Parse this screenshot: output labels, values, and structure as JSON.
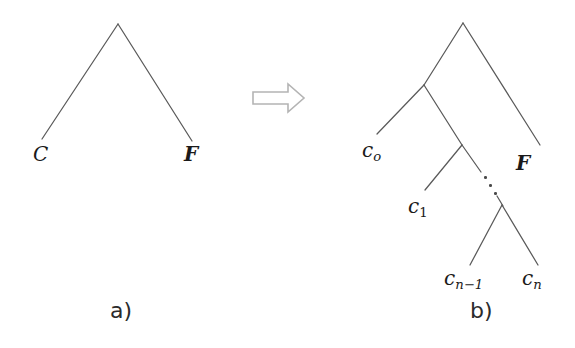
{
  "figure": {
    "background_color": "#ffffff",
    "line_color": "#5a5a5a",
    "arrow_outline_color": "#b4b4b4",
    "text_color": "#1a1a1a"
  },
  "panel_a": {
    "caption": "a)",
    "caption_position": {
      "x": 110,
      "y": 300
    },
    "tree": {
      "root": {
        "x": 118,
        "y": 24
      },
      "edges": [
        {
          "name": "root-to-C",
          "x1": 118,
          "y1": 24,
          "x2": 42,
          "y2": 139
        },
        {
          "name": "root-to-F",
          "x1": 118,
          "y1": 24,
          "x2": 192,
          "y2": 141
        }
      ],
      "leaves": [
        {
          "id": "C",
          "label": "C",
          "style": "italic",
          "x": 33,
          "y": 144
        },
        {
          "id": "F",
          "label": "F",
          "style": "bold-italic",
          "x": 184,
          "y": 144
        }
      ]
    }
  },
  "arrow": {
    "name": "double-right-arrow",
    "label": "implies",
    "x": 253,
    "y": 84,
    "width": 52,
    "height": 28
  },
  "panel_b": {
    "caption": "b)",
    "caption_position": {
      "x": 470,
      "y": 300
    },
    "tree": {
      "root": {
        "x": 463,
        "y": 23
      },
      "internal_nodes": [
        {
          "id": "n1",
          "x": 424,
          "y": 85
        },
        {
          "id": "n2",
          "x": 462,
          "y": 145
        },
        {
          "id": "n3",
          "x": 502,
          "y": 205
        }
      ],
      "edges": [
        {
          "name": "root-to-n1",
          "x1": 463,
          "y1": 23,
          "x2": 424,
          "y2": 85
        },
        {
          "name": "root-to-F",
          "x1": 463,
          "y1": 23,
          "x2": 540,
          "y2": 145
        },
        {
          "name": "n1-to-c0",
          "x1": 424,
          "y1": 85,
          "x2": 377,
          "y2": 134
        },
        {
          "name": "n1-to-n2",
          "x1": 424,
          "y1": 85,
          "x2": 462,
          "y2": 145
        },
        {
          "name": "n2-to-c1",
          "x1": 462,
          "y1": 145,
          "x2": 425,
          "y2": 190
        },
        {
          "name": "n2-to-ellipsis",
          "x1": 462,
          "y1": 145,
          "x2": 481,
          "y2": 172
        },
        {
          "name": "ellipsis-to-n3",
          "x1": 496,
          "y1": 194,
          "x2": 502,
          "y2": 205
        },
        {
          "name": "n3-to-cn-1",
          "x1": 502,
          "y1": 205,
          "x2": 470,
          "y2": 265
        },
        {
          "name": "n3-to-cn",
          "x1": 502,
          "y1": 205,
          "x2": 538,
          "y2": 265
        }
      ],
      "ellipsis": {
        "name": "diagonal-ellipsis",
        "dots": [
          {
            "x": 484,
            "y": 176
          },
          {
            "x": 489,
            "y": 184
          },
          {
            "x": 494,
            "y": 192
          }
        ]
      },
      "leaves": [
        {
          "id": "c0",
          "base": "c",
          "subscript": "o",
          "subscript_style": "italic",
          "x": 362,
          "y": 140
        },
        {
          "id": "c1",
          "base": "c",
          "subscript": "1",
          "subscript_style": "upright",
          "x": 408,
          "y": 196
        },
        {
          "id": "cn-1",
          "base": "c",
          "subscript": "n−1",
          "subscript_style": "italic",
          "x": 444,
          "y": 268
        },
        {
          "id": "cn",
          "base": "c",
          "subscript": "n",
          "subscript_style": "italic",
          "x": 522,
          "y": 268
        },
        {
          "id": "F",
          "label": "F",
          "style": "bold-italic",
          "x": 516,
          "y": 153
        }
      ]
    }
  }
}
